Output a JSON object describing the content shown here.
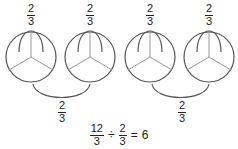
{
  "diagram": {
    "groups": [
      {
        "circles": [
          {
            "cx": 31,
            "cy": 57,
            "r": 25,
            "label": {
              "num": "2",
              "den": "3"
            }
          },
          {
            "cx": 90,
            "cy": 57,
            "r": 25,
            "label": {
              "num": "2",
              "den": "3"
            }
          }
        ],
        "link_label": {
          "num": "2",
          "den": "3"
        }
      },
      {
        "circles": [
          {
            "cx": 150,
            "cy": 57,
            "r": 25,
            "label": {
              "num": "2",
              "den": "3"
            }
          },
          {
            "cx": 209,
            "cy": 57,
            "r": 25,
            "label": {
              "num": "2",
              "den": "3"
            }
          }
        ],
        "link_label": {
          "num": "2",
          "den": "3"
        }
      }
    ],
    "equation": {
      "left": {
        "num": "12",
        "den": "3"
      },
      "operator": "÷",
      "right": {
        "num": "2",
        "den": "3"
      },
      "equals": "=",
      "result": "6"
    },
    "stroke_color": "#555555",
    "divider_color": "#999999"
  }
}
